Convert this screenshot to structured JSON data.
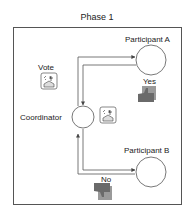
{
  "title": "Phase 1",
  "nodes": {
    "coordinator": "Coordinator",
    "participant_a": "Participant A",
    "participant_b": "Participant B"
  },
  "labels": {
    "vote": "Vote",
    "yes": "Yes",
    "no": "No"
  },
  "icons": {
    "ballot_box_1": "ballot-box-icon",
    "ballot_box_2": "ballot-box-icon",
    "thumbs_up": "thumbs-up-icon",
    "thumbs_down": "thumbs-down-icon"
  },
  "colors": {
    "line": "#555555",
    "hand": "#6a6a6a",
    "hand_bg": "#9a9a9a"
  }
}
